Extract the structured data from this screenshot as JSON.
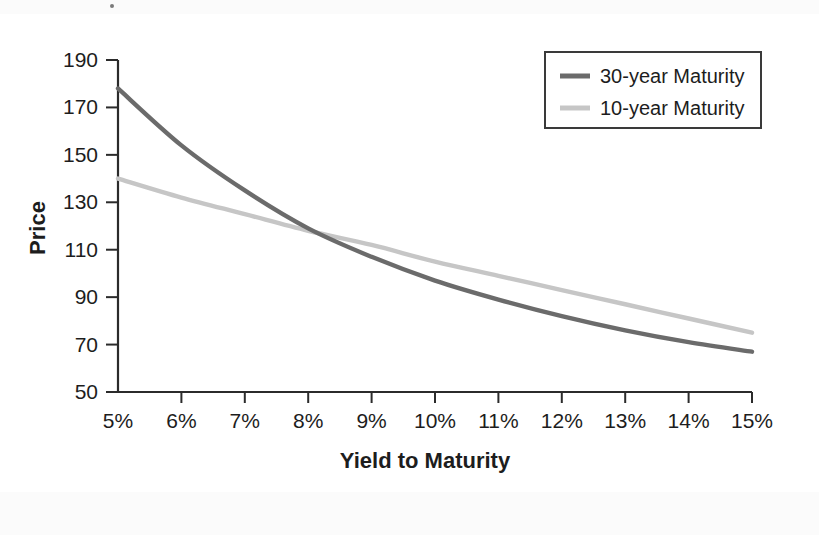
{
  "chart_data": {
    "type": "line",
    "title": "",
    "xlabel": "Yield to Maturity",
    "ylabel": "Price",
    "xlim": [
      5,
      15
    ],
    "ylim": [
      50,
      190
    ],
    "grid": false,
    "legend_position": "top-right",
    "x": [
      5,
      6,
      7,
      8,
      9,
      10,
      11,
      12,
      13,
      14,
      15
    ],
    "xticklabels": [
      "5%",
      "6%",
      "7%",
      "8%",
      "9%",
      "10%",
      "11%",
      "12%",
      "13%",
      "14%",
      "15%"
    ],
    "yticks": [
      50,
      70,
      90,
      110,
      130,
      150,
      170,
      190
    ],
    "yticklabels": [
      "50",
      "70",
      "90",
      "110",
      "130",
      "150",
      "170",
      "190"
    ],
    "series": [
      {
        "name": "30-year Maturity",
        "color": "#6b6b6b",
        "values": [
          178,
          154,
          135,
          119,
          107,
          97,
          89,
          82,
          76,
          71,
          67
        ]
      },
      {
        "name": "10-year Maturity",
        "color": "#c6c6c6",
        "values": [
          140,
          132,
          125,
          118,
          112,
          105,
          99,
          93,
          87,
          81,
          75
        ]
      }
    ]
  },
  "legend": {
    "entries": [
      {
        "label": "30-year Maturity",
        "swatch": "line-swatch-dark"
      },
      {
        "label": "10-year Maturity",
        "swatch": "line-swatch-light"
      }
    ]
  },
  "axes": {
    "y_title": "Price",
    "x_title": "Yield to Maturity"
  }
}
